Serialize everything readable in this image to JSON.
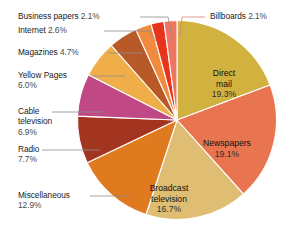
{
  "chart_data": {
    "type": "pie",
    "title": "",
    "subtitle": "",
    "xlabel": "",
    "ylabel": "",
    "legend_position": "none",
    "grid": false,
    "units": "percent",
    "start_angle_deg": 0,
    "direction": "clockwise",
    "categories": [
      "Direct mail",
      "Newspapers",
      "Broadcast television",
      "Miscellaneous",
      "Radio",
      "Cable television",
      "Yellow Pages",
      "Magazines",
      "Internet",
      "Business papers",
      "Billboards"
    ],
    "values": [
      19.3,
      19.1,
      16.7,
      12.9,
      7.7,
      6.9,
      6.0,
      4.7,
      2.6,
      2.1,
      2.1
    ],
    "colors": [
      "#d2b23f",
      "#e8754f",
      "#dfbd72",
      "#e07a1e",
      "#a33520",
      "#c04884",
      "#f0ae4a",
      "#b85a28",
      "#f08a3c",
      "#e8341c",
      "#ee7560"
    ],
    "slices": [
      {
        "label": "Direct mail",
        "value": 19.3,
        "value_text": "19.3%",
        "color": "#d2b23f",
        "label_placement": "inside"
      },
      {
        "label": "Newspapers",
        "value": 19.1,
        "value_text": "19.1%",
        "color": "#e8754f",
        "label_placement": "inside"
      },
      {
        "label": "Broadcast television",
        "value": 16.7,
        "value_text": "16.7%",
        "color": "#dfbd72",
        "label_placement": "inside"
      },
      {
        "label": "Miscellaneous",
        "value": 12.9,
        "value_text": "12.9%",
        "color": "#e07a1e",
        "label_placement": "outside-left"
      },
      {
        "label": "Radio",
        "value": 7.7,
        "value_text": "7.7%",
        "color": "#a33520",
        "label_placement": "outside-left"
      },
      {
        "label": "Cable television",
        "value": 6.9,
        "value_text": "6.9%",
        "color": "#c04884",
        "label_placement": "outside-left"
      },
      {
        "label": "Yellow Pages",
        "value": 6.0,
        "value_text": "6.0%",
        "color": "#f0ae4a",
        "label_placement": "outside-left"
      },
      {
        "label": "Magazines",
        "value": 4.7,
        "value_text": "4.7%",
        "color": "#b85a28",
        "label_placement": "outside-left"
      },
      {
        "label": "Internet",
        "value": 2.6,
        "value_text": "2.6%",
        "color": "#f08a3c",
        "label_placement": "outside-left"
      },
      {
        "label": "Business papers",
        "value": 2.1,
        "value_text": "2.1%",
        "color": "#e8341c",
        "label_placement": "outside-left"
      },
      {
        "label": "Billboards",
        "value": 2.1,
        "value_text": "2.1%",
        "color": "#ee7560",
        "label_placement": "outside-right"
      }
    ],
    "edge_shadow_color": "#232a5c",
    "slice_separator_color": "#ffffff",
    "background_color": "#ffffff"
  },
  "labels": {
    "business_papers": {
      "name": "Business papers ",
      "pct": "2.1%"
    },
    "internet": {
      "name": "Internet ",
      "pct": "2.6%"
    },
    "magazines": {
      "name": "Magazines ",
      "pct": "4.7%"
    },
    "yellow_pages": {
      "name": "Yellow Pages",
      "pct": "6.0%"
    },
    "cable_tv_l1": {
      "name": "Cable"
    },
    "cable_tv_l2": {
      "name": "television"
    },
    "cable_tv_pct": {
      "pct": "6.9%"
    },
    "radio": {
      "name": "Radio",
      "pct": "7.7%"
    },
    "miscellaneous": {
      "name": "Miscellaneous",
      "pct": "12.9%"
    },
    "billboards": {
      "name": "Billboards ",
      "pct": "2.1%"
    },
    "direct_mail_l1": {
      "name": "Direct"
    },
    "direct_mail_l2": {
      "name": "mail"
    },
    "direct_mail_pct": {
      "pct": "19.3%"
    },
    "newspapers": {
      "name": "Newspapers",
      "pct": "19.1%"
    },
    "broadcast_l1": {
      "name": "Broadcast"
    },
    "broadcast_l2": {
      "name": "television"
    },
    "broadcast_pct": {
      "pct": "16.7%"
    }
  }
}
